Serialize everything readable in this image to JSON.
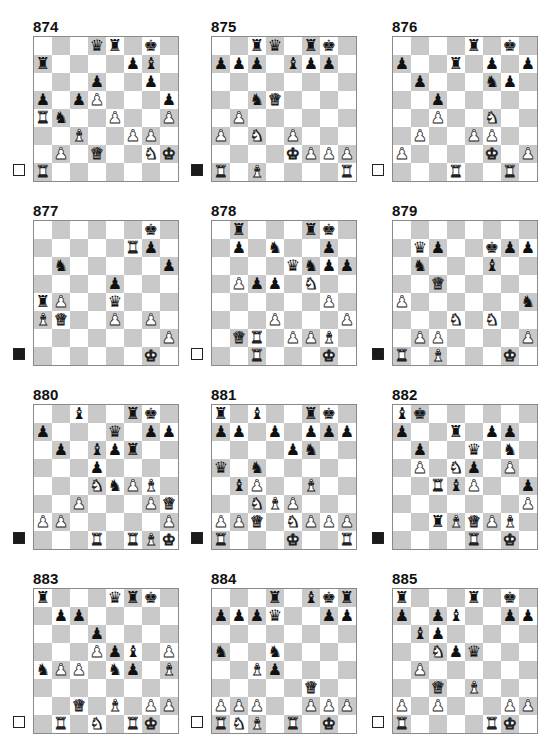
{
  "colors": {
    "light_square": "#ffffff",
    "dark_square": "#c9c9c9",
    "border": "#8a8a8a"
  },
  "piece_glyphs": {
    "K": "♚",
    "Q": "♛",
    "R": "♜",
    "B": "♝",
    "N": "♞",
    "P": "♟",
    "k": "♚",
    "q": "♛",
    "r": "♜",
    "b": "♝",
    "n": "♞",
    "p": "♟"
  },
  "puzzles": [
    {
      "number": "874",
      "to_move": "white",
      "x": 13,
      "y": 18,
      "rows": [
        "...qr.k.",
        "r....pb.",
        "...p..p.",
        "p.pP...p",
        "Rn..P..P",
        "..B..PP.",
        ".P.Q..NK",
        "R......."
      ]
    },
    {
      "number": "875",
      "to_move": "black",
      "x": 191,
      "y": 18,
      "rows": [
        "..rq.rk.",
        "ppp.bpp.",
        "........",
        "..nQ....",
        ".P......",
        "P.N.P...",
        "....KPPP",
        "R.B....R"
      ]
    },
    {
      "number": "876",
      "to_move": "white",
      "x": 372,
      "y": 18,
      "rows": [
        "....r.k.",
        "p..r.p.p",
        ".p...np.",
        "..p.....",
        "..P..N..",
        ".P..PP..",
        "P....K.P",
        "...R..R."
      ]
    },
    {
      "number": "877",
      "to_move": "black",
      "x": 13,
      "y": 202,
      "rows": [
        "......k.",
        ".....Rp.",
        ".n.....p",
        "....p...",
        "rP..q...",
        "BQ..P.P.",
        ".......P",
        "......K."
      ]
    },
    {
      "number": "878",
      "to_move": "white",
      "x": 191,
      "y": 202,
      "rows": [
        ".r...rk.",
        ".p.n..p.",
        "....qnpp",
        ".Ppp.N..",
        "......P.",
        "...P...P",
        ".QR.PPB.",
        "..R...K."
      ]
    },
    {
      "number": "879",
      "to_move": "black",
      "x": 372,
      "y": 202,
      "rows": [
        "........",
        ".qp..kpp",
        ".n...b..",
        "..Q.....",
        "P......n",
        "...N.N..",
        ".PP....P",
        "R.B...K."
      ]
    },
    {
      "number": "880",
      "to_move": "black",
      "x": 13,
      "y": 386,
      "rows": [
        "..b..rk.",
        "p...q.pp",
        ".p.bpr..",
        "...p....",
        "...NnPB.",
        "..P...PQ",
        "PP.....P",
        "...R.RBK"
      ]
    },
    {
      "number": "881",
      "to_move": "black",
      "x": 191,
      "y": 386,
      "rows": [
        "r.b..rk.",
        "pp.p.ppp",
        "....pn..",
        "q.n.....",
        ".bP..B..",
        "..NBP...",
        "PPQ.NPPP",
        "R...K..R"
      ]
    },
    {
      "number": "882",
      "to_move": "black",
      "x": 372,
      "y": 386,
      "rows": [
        "bk......",
        "p..r.pp.",
        ".p..q.n.",
        ".P.Np.P.",
        "..RbP..p",
        ".......P",
        "..rBQPB.",
        "....R.K."
      ]
    },
    {
      "number": "883",
      "to_move": "white",
      "x": 13,
      "y": 570,
      "rows": [
        "r...qrk.",
        ".pp.....",
        "...p....",
        "...Ppb.P",
        "nPP.np.B",
        "........",
        "..Q.B.PP",
        ".R.N.RK."
      ]
    },
    {
      "number": "884",
      "to_move": "white",
      "x": 191,
      "y": 570,
      "rows": [
        "...r.bkr",
        "pppq..pp",
        "........",
        "n..n....",
        "..Bp....",
        ".....Q..",
        "PPP..PPP",
        "RNB.R.K."
      ]
    },
    {
      "number": "885",
      "to_move": "white",
      "x": 372,
      "y": 570,
      "rows": [
        "r...r.k.",
        "p.pb..pp",
        ".bp.....",
        "..Npq...",
        ".P......",
        "..Q.B...",
        "P.P...PP",
        "R....RK."
      ]
    }
  ]
}
